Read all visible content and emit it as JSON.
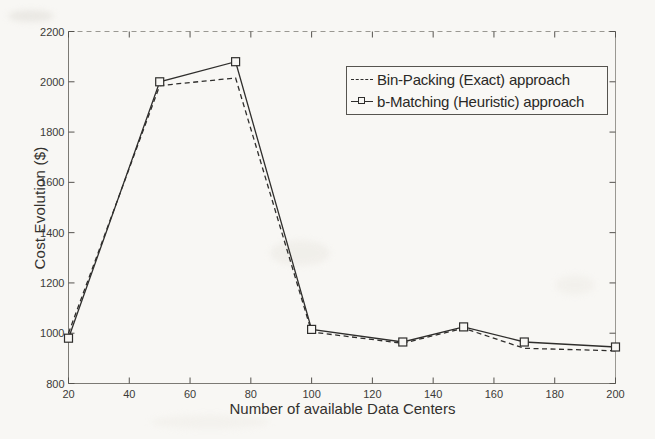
{
  "chart_data": {
    "type": "line",
    "title": "",
    "xlabel": "Number of available Data Centers",
    "ylabel": "Cost Evolution ($)",
    "xlim": [
      20,
      200
    ],
    "ylim": [
      800,
      2200
    ],
    "xticks": [
      20,
      40,
      60,
      80,
      100,
      120,
      140,
      160,
      180,
      200
    ],
    "yticks": [
      800,
      1000,
      1200,
      1400,
      1600,
      1800,
      2000,
      2200
    ],
    "grid": false,
    "legend_position": "upper right",
    "x": [
      20,
      50,
      75,
      100,
      130,
      150,
      170,
      200
    ],
    "series": [
      {
        "name": "Bin-Packing (Exact) approach",
        "style": "dashed",
        "marker": "none",
        "color": "#2f2e2c",
        "values": [
          1000,
          1985,
          2015,
          1005,
          960,
          1020,
          940,
          930
        ]
      },
      {
        "name": "b-Matching (Heuristic) approach",
        "style": "solid",
        "marker": "open-square",
        "color": "#2f2e2c",
        "values": [
          980,
          2000,
          2080,
          1015,
          965,
          1025,
          965,
          945
        ]
      }
    ]
  },
  "colors": {
    "background": "#f8f7f4",
    "axis": "#7c7a74",
    "axis_light": "#9a9892",
    "tick": "#55534e",
    "ink": "#2f2e2c"
  }
}
